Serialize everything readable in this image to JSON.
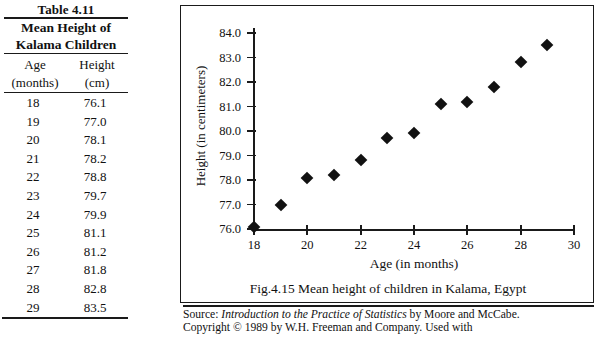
{
  "table": {
    "title": "Table 4.11",
    "subtitle_line1": "Mean Height of",
    "subtitle_line2": "Kalama Children",
    "col_age_line1": "Age",
    "col_age_line2": "(months)",
    "col_height_line1": "Height",
    "col_height_line2": "(cm)",
    "rows": [
      {
        "age": "18",
        "height": "76.1"
      },
      {
        "age": "19",
        "height": "77.0"
      },
      {
        "age": "20",
        "height": "78.1"
      },
      {
        "age": "21",
        "height": "78.2"
      },
      {
        "age": "22",
        "height": "78.8"
      },
      {
        "age": "23",
        "height": "79.7"
      },
      {
        "age": "24",
        "height": "79.9"
      },
      {
        "age": "25",
        "height": "81.1"
      },
      {
        "age": "26",
        "height": "81.2"
      },
      {
        "age": "27",
        "height": "81.8"
      },
      {
        "age": "28",
        "height": "82.8"
      },
      {
        "age": "29",
        "height": "83.5"
      }
    ]
  },
  "figure": {
    "caption": "Fig.4.15  Mean height of children in Kalama, Egypt"
  },
  "source": {
    "label": "Source:",
    "book_title": "Introduction to the Practice of Statistics",
    "authors_text": " by Moore and McCabe.",
    "copyright_line": "Copyright © 1989 by W.H. Freeman and Company. Used with"
  },
  "chart_data": {
    "type": "scatter",
    "title": "",
    "xlabel": "Age (in months)",
    "ylabel": "Height (in centimeters)",
    "x": [
      18,
      19,
      20,
      21,
      22,
      23,
      24,
      25,
      26,
      27,
      28,
      29
    ],
    "values": [
      76.1,
      77.0,
      78.1,
      78.2,
      78.8,
      79.7,
      79.9,
      81.1,
      81.2,
      81.8,
      82.8,
      83.5
    ],
    "xlim": [
      18,
      30
    ],
    "ylim": [
      76.0,
      84.0
    ],
    "xticks": [
      18,
      20,
      22,
      24,
      26,
      28,
      30
    ],
    "xtick_labels": [
      "18",
      "20",
      "22",
      "24",
      "26",
      "28",
      "30"
    ],
    "yticks": [
      76.0,
      77.0,
      78.0,
      79.0,
      80.0,
      81.0,
      82.0,
      83.0,
      84.0
    ],
    "ytick_labels": [
      "76.0",
      "77.0",
      "78.0",
      "79.0",
      "80.0",
      "81.0",
      "82.0",
      "83.0",
      "84.0"
    ],
    "grid": false,
    "legend": null,
    "marker": "diamond",
    "marker_color": "#111111"
  }
}
